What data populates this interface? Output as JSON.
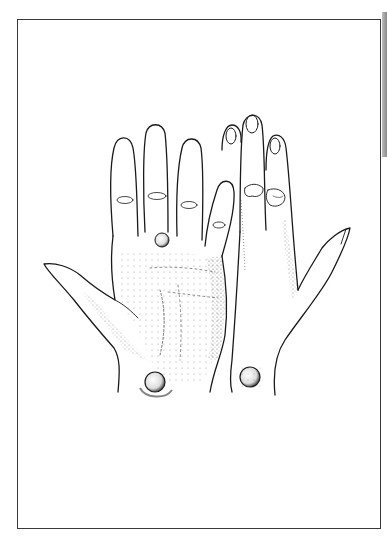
{
  "illustration": {
    "subject": "Palmar view of left hand and dorsal view of right hand, each with a round nodule",
    "alt": "Line and stipple drawing of two hands side by side with round lesions at the wrists and a nodule at the base of the middle/ring finger",
    "colors": {
      "ink": "#1a1a1a",
      "frame": "#3a3a3a",
      "background": "#ffffff",
      "edge_strip": "#9a9a9a"
    },
    "elements": [
      "left-hand-palm",
      "right-hand-dorsum",
      "palm-nodule",
      "left-wrist-nodule",
      "right-wrist-nodule",
      "finger-joint-swellings"
    ]
  }
}
